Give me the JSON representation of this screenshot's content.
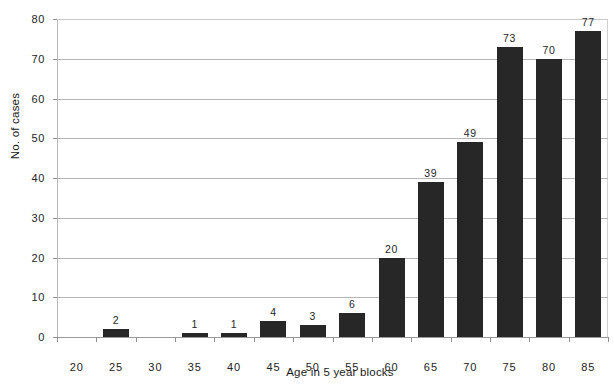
{
  "chart_data": {
    "type": "bar",
    "title": "",
    "subtitle": "",
    "xlabel": "Age in 5 year blocks",
    "ylabel": "No. of cases",
    "categories": [
      "20",
      "25",
      "30",
      "35",
      "40",
      "45",
      "50",
      "55",
      "60",
      "65",
      "70",
      "75",
      "80",
      "85"
    ],
    "values": [
      0,
      2,
      0,
      1,
      1,
      4,
      3,
      6,
      20,
      39,
      49,
      73,
      70,
      77
    ],
    "data_labels": [
      "",
      "2",
      "",
      "1",
      "1",
      "4",
      "3",
      "6",
      "20",
      "39",
      "49",
      "73",
      "70",
      "77"
    ],
    "ylim": [
      0,
      80
    ],
    "ytick_labels": [
      "80",
      "70",
      "60",
      "50",
      "40",
      "30",
      "20",
      "10",
      "0"
    ],
    "ytick_values": [
      80,
      70,
      60,
      50,
      40,
      30,
      20,
      10,
      0
    ],
    "grid": true,
    "grid_axis": "y",
    "legend": false,
    "legend_position": "none",
    "bar_color": "#272727",
    "grid_color": "#b5b5b5",
    "axis_color": "#8e8e8e",
    "background_color": "#ffffff",
    "series": [
      {
        "name": "No. of cases",
        "values": [
          0,
          2,
          0,
          1,
          1,
          4,
          3,
          6,
          20,
          39,
          49,
          73,
          70,
          77
        ]
      }
    ]
  }
}
